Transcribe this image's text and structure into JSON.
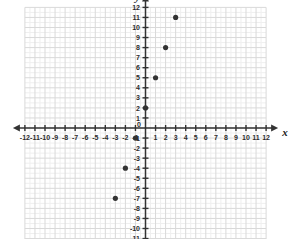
{
  "figure": {
    "kind": "coordinate-plane-scatter-plot",
    "background_color": "#ffffff"
  },
  "axes": {
    "x_axis_name": "x",
    "y_axis_name": "y",
    "axis_color": "#333333",
    "major_grid_color": "#d9d9d9",
    "minor_grid_color": "#efefef",
    "origin_label": "0",
    "x_tick_labels_negative": [
      "-12",
      "-11",
      "-10",
      "-9",
      "-8",
      "-7",
      "-6",
      "-5",
      "-4",
      "-3",
      "-2",
      "-1"
    ],
    "x_tick_labels_positive": [
      "1",
      "2",
      "3",
      "4",
      "5",
      "6",
      "7",
      "8",
      "9",
      "10",
      "11",
      "12"
    ],
    "y_tick_labels_positive": [
      "1",
      "2",
      "3",
      "4",
      "5",
      "6",
      "7",
      "8",
      "9",
      "10",
      "11",
      "12"
    ],
    "y_tick_labels_negative": [
      "-1",
      "-2",
      "-3",
      "-4",
      "-5",
      "-6",
      "-7",
      "-8",
      "-9",
      "-10",
      "-11",
      "-12"
    ]
  },
  "chart_data": {
    "type": "scatter",
    "title": "",
    "subtitle": "",
    "xlabel": "x",
    "ylabel": "y",
    "xlim": [
      -12,
      12
    ],
    "ylim": [
      -12,
      12
    ],
    "xticks": [
      -12,
      -11,
      -10,
      -9,
      -8,
      -7,
      -6,
      -5,
      -4,
      -3,
      -2,
      -1,
      0,
      1,
      2,
      3,
      4,
      5,
      6,
      7,
      8,
      9,
      10,
      11,
      12
    ],
    "yticks": [
      -12,
      -11,
      -10,
      -9,
      -8,
      -7,
      -6,
      -5,
      -4,
      -3,
      -2,
      -1,
      0,
      1,
      2,
      3,
      4,
      5,
      6,
      7,
      8,
      9,
      10,
      11,
      12
    ],
    "grid": true,
    "minor_grid": true,
    "minor_grid_divisions": 2,
    "legend": false,
    "legend_position": "none",
    "annotations": [],
    "point_color": "#333333",
    "point_radius_px": 2.6,
    "series": [
      {
        "name": "plotted points",
        "x": [
          -3,
          -2,
          -1,
          0,
          1,
          2,
          3
        ],
        "y": [
          -7,
          -4,
          -1,
          2,
          5,
          8,
          11
        ],
        "points": [
          {
            "label": "(-3, -7)",
            "x": -3,
            "y": -7
          },
          {
            "label": "(-2, -4)",
            "x": -2,
            "y": -4
          },
          {
            "label": "(-1, -1)",
            "x": -1,
            "y": -1
          },
          {
            "label": "(0, 2)",
            "x": 0,
            "y": 2
          },
          {
            "label": "(1, 5)",
            "x": 1,
            "y": 5
          },
          {
            "label": "(2, 8)",
            "x": 2,
            "y": 8
          },
          {
            "label": "(3, 11)",
            "x": 3,
            "y": 11
          }
        ]
      }
    ]
  }
}
